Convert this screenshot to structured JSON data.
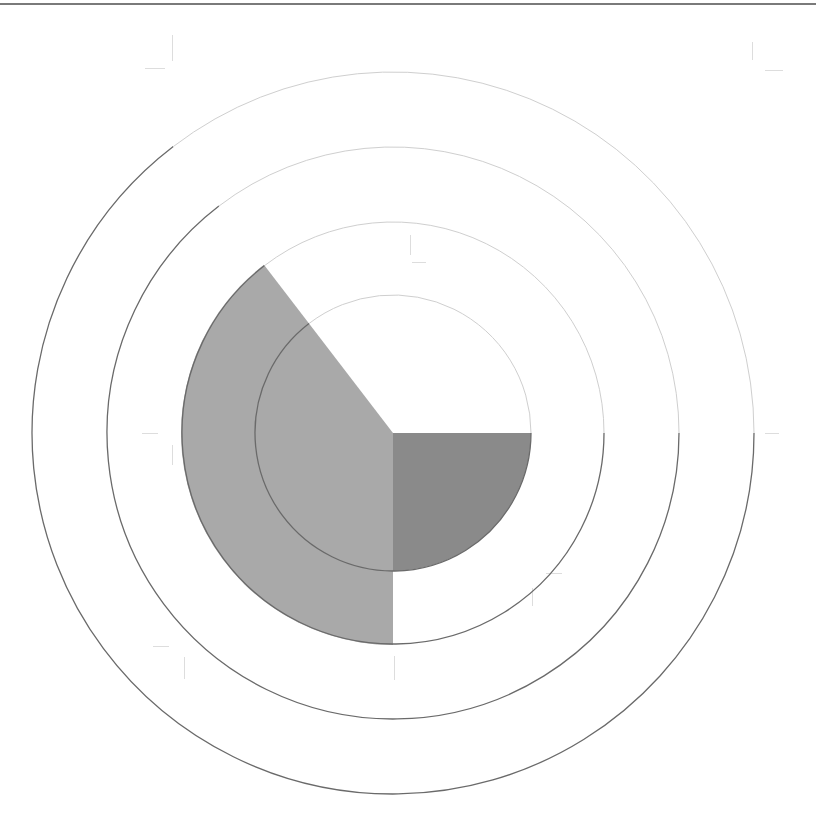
{
  "chart_data": {
    "type": "polar_area",
    "title": "",
    "center": [
      393,
      433
    ],
    "ring_radii_px": [
      138,
      211,
      286,
      361
    ],
    "ring_colors": {
      "upper": "#cfcfcf",
      "lower": "#6a6a6a"
    },
    "sectors": [
      {
        "name": "sector-1",
        "start_deg": 0,
        "end_deg": 90,
        "value": 0,
        "radius_px": 0,
        "color": "#ffffff"
      },
      {
        "name": "sector-2",
        "start_deg": 90,
        "end_deg": 180,
        "value": 1,
        "radius_px": 138,
        "color": "#8a8a8a"
      },
      {
        "name": "sector-3",
        "start_deg": 180,
        "end_deg": 322.5,
        "value": 2,
        "radius_px": 212,
        "color": "#a9a9a9"
      },
      {
        "name": "sector-4",
        "start_deg": 322.5,
        "end_deg": 360,
        "value": 0,
        "radius_px": 0,
        "color": "#ffffff"
      }
    ],
    "grid": true,
    "legend": null,
    "xlabel": "",
    "ylabel": ""
  },
  "colors": {
    "border": "#7a7a7a",
    "crop_marks": "#dddddd"
  },
  "crop_marks": [
    {
      "x": 172,
      "y": 35,
      "w": 1,
      "h": 26
    },
    {
      "x": 145,
      "y": 68,
      "w": 20,
      "h": 1
    },
    {
      "x": 752,
      "y": 42,
      "w": 1,
      "h": 18
    },
    {
      "x": 765,
      "y": 70,
      "w": 18,
      "h": 1
    },
    {
      "x": 410,
      "y": 235,
      "w": 1,
      "h": 20
    },
    {
      "x": 412,
      "y": 262,
      "w": 14,
      "h": 1
    },
    {
      "x": 142,
      "y": 433,
      "w": 16,
      "h": 1
    },
    {
      "x": 172,
      "y": 445,
      "w": 1,
      "h": 20
    },
    {
      "x": 765,
      "y": 433,
      "w": 14,
      "h": 1
    },
    {
      "x": 546,
      "y": 573,
      "w": 16,
      "h": 1
    },
    {
      "x": 532,
      "y": 588,
      "w": 1,
      "h": 18
    },
    {
      "x": 153,
      "y": 646,
      "w": 16,
      "h": 1
    },
    {
      "x": 184,
      "y": 657,
      "w": 1,
      "h": 22
    },
    {
      "x": 394,
      "y": 656,
      "w": 1,
      "h": 24
    }
  ]
}
